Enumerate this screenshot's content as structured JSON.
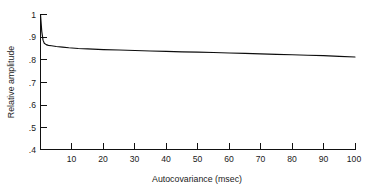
{
  "chart_data": {
    "type": "line",
    "title": "",
    "subtitle": "",
    "xlabel": "Autocovariance (msec)",
    "ylabel": "Relative amplitude",
    "xlim": [
      0,
      100
    ],
    "ylim": [
      0.4,
      1.0
    ],
    "grid": false,
    "legend": null,
    "x_ticks": [
      10,
      20,
      30,
      40,
      50,
      60,
      70,
      80,
      90,
      100
    ],
    "x_tick_labels": [
      "10",
      "20",
      "30",
      "40",
      "50",
      "60",
      "70",
      "80",
      "90",
      "100"
    ],
    "y_ticks": [
      0.4,
      0.5,
      0.6,
      0.7,
      0.8,
      0.9,
      1.0
    ],
    "y_tick_labels": [
      ".4",
      ".5",
      ".6",
      ".7",
      ".8",
      ".9",
      "1"
    ],
    "series": [
      {
        "name": "relative amplitude",
        "color": "#0d0d0d",
        "x": [
          0,
          0.4,
          0.8,
          1.2,
          1.8,
          2.5,
          3.5,
          5,
          7,
          9,
          12,
          15,
          20,
          25,
          30,
          35,
          40,
          45,
          50,
          55,
          60,
          65,
          70,
          75,
          80,
          85,
          90,
          95,
          100
        ],
        "values": [
          1.0,
          0.925,
          0.886,
          0.872,
          0.866,
          0.863,
          0.861,
          0.858,
          0.855,
          0.852,
          0.849,
          0.847,
          0.844,
          0.842,
          0.84,
          0.838,
          0.836,
          0.834,
          0.833,
          0.831,
          0.829,
          0.827,
          0.825,
          0.823,
          0.821,
          0.819,
          0.817,
          0.814,
          0.811
        ]
      }
    ]
  },
  "axes": {
    "y_title": "Relative amplitude",
    "x_title": "Autocovariance (msec)"
  },
  "y_labels": {
    "t0": "1",
    "t1": ".9",
    "t2": ".8",
    "t3": ".7",
    "t4": ".6",
    "t5": ".5",
    "t6": ".4"
  },
  "x_labels": {
    "t0": "10",
    "t1": "20",
    "t2": "30",
    "t3": "40",
    "t4": "50",
    "t5": "60",
    "t6": "70",
    "t7": "80",
    "t8": "90",
    "t9": "100"
  },
  "colors": {
    "curve": "#0d0d0d",
    "axis": "#111111",
    "background": "#ffffff",
    "text": "#1a1a1a"
  }
}
